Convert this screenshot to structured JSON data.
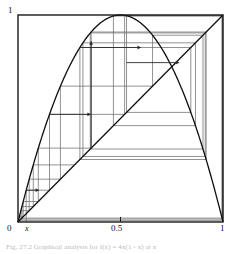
{
  "figure": {
    "caption": "Fig. 27.2   Graphical analysis for f(x) = 4x(1 - x) at x"
  },
  "axes": {
    "y_label_top": "1",
    "x_label_origin": "0",
    "x_label_var": "x",
    "x_label_mid": "0.5",
    "x_label_right": "1",
    "xlim": [
      0,
      1
    ],
    "ylim": [
      0,
      1
    ]
  },
  "colors": {
    "frame": "#1a1a1a",
    "curve": "#0d0d0d",
    "diagonal": "#0d0d0d",
    "cobweb": "#6e6e6e",
    "arrow": "#2b2b2b",
    "background": "#ffffff"
  },
  "chart_data": {
    "type": "line",
    "title": "",
    "subtitle": "",
    "xlabel": "x",
    "ylabel": "",
    "xlim": [
      0,
      1
    ],
    "ylim": [
      0,
      1
    ],
    "grid": false,
    "legend": "none",
    "xticks": [
      0,
      0.5,
      1
    ],
    "xticklabels": [
      "0",
      "0.5",
      "1"
    ],
    "yticks": [
      1
    ],
    "yticklabels": [
      "1"
    ],
    "annotations": [
      {
        "text": "x",
        "x": 0.04,
        "y": -0.04,
        "style": "italic"
      }
    ],
    "series": [
      {
        "name": "f(x) = 4x(1-x)",
        "type": "curve",
        "formula": "4*x*(1-x)",
        "samples": 241
      },
      {
        "name": "y = x",
        "type": "line",
        "x": [
          0,
          1
        ],
        "values": [
          0,
          1
        ]
      },
      {
        "name": "cobweb orbit",
        "type": "cobweb",
        "map": "4*x*(1-x)",
        "x0": 0.04,
        "iterations": 26,
        "orbit": [
          0.04,
          0.1536,
          0.52002,
          0.9984,
          0.00639,
          0.0254,
          0.09902,
          0.35685,
          0.91775,
          0.30192,
          0.84296,
          0.52949,
          0.99652,
          0.01387,
          0.05472,
          0.20691,
          0.65638,
          0.90229,
          0.35272,
          0.9133,
          0.31674,
          0.86564,
          0.46546,
          0.99523,
          0.01899,
          0.07452,
          0.27591
        ]
      }
    ],
    "arrow_markers": [
      {
        "kind": "horizontal-right",
        "x_from": 0.04,
        "x_to": 0.1536,
        "y": 0.1536
      },
      {
        "kind": "horizontal-right",
        "x_from": 0.1536,
        "x_to": 0.52002,
        "y": 0.52002
      },
      {
        "kind": "vertical-up",
        "x": 0.35685,
        "y_from": 0.35685,
        "y_to": 0.91775
      },
      {
        "kind": "horizontal-right",
        "x_from": 0.30192,
        "x_to": 0.84296,
        "y": 0.84296
      },
      {
        "kind": "horizontal-right",
        "x_from": 0.52949,
        "x_to": 0.99652,
        "y": 0.77
      }
    ]
  }
}
